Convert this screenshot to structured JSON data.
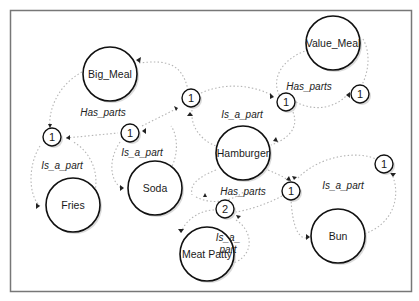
{
  "diagram": {
    "type": "semantic-network",
    "nodes": {
      "big_meal": {
        "label": "Big_Meal"
      },
      "value_meal": {
        "label": "Value_Meal"
      },
      "hamburger": {
        "label": "Hamburger"
      },
      "fries": {
        "label": "Fries"
      },
      "soda": {
        "label": "Soda"
      },
      "meat_patty": {
        "label": "Meat Patty"
      },
      "bun": {
        "label": "Bun"
      }
    },
    "cardinalities": {
      "c_fries": "1",
      "c_soda": "1",
      "c_center": "1",
      "c_value_left": "1",
      "c_value_right": "1",
      "c_bun_left": "1",
      "c_bun_right": "1",
      "c_patty": "2"
    },
    "edge_labels": {
      "big_meal_has_parts": "Has_parts",
      "value_meal_has_parts": "Has_parts",
      "hamburger_is_a_part": "Is_a_part",
      "fries_is_a_part": "Is_a_part",
      "soda_is_a_part": "Is_a_part",
      "hamburger_has_parts": "Has_parts",
      "bun_is_a_part": "Is_a_part",
      "patty_is_a_part_line1": "Is_a_",
      "patty_is_a_part_line2": "part"
    }
  }
}
